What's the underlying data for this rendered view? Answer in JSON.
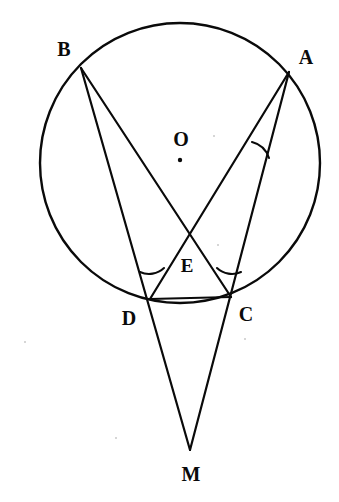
{
  "figure": {
    "background_color": "#ffffff",
    "stroke_color": "#0a0a0a",
    "width": 339,
    "height": 502
  },
  "circle": {
    "name": "circumscribed-circle",
    "center_x": 180,
    "center_y": 163,
    "radius": 140,
    "stroke_width": 2.4
  },
  "center_marker": {
    "name": "center-dot",
    "x": 180,
    "y": 160,
    "radius": 2.2
  },
  "points": [
    {
      "id": "B",
      "label": "B",
      "x": 81,
      "y": 68,
      "label_x": 64,
      "label_y": 49,
      "size": "lbl-20"
    },
    {
      "id": "A",
      "label": "A",
      "x": 289,
      "y": 72,
      "label_x": 306,
      "label_y": 57,
      "size": "lbl-20"
    },
    {
      "id": "O",
      "label": "O",
      "x": 180,
      "y": 160,
      "label_x": 181,
      "label_y": 139,
      "size": "lbl-20"
    },
    {
      "id": "E",
      "label": "E",
      "x": 190,
      "y": 237,
      "label_x": 187,
      "label_y": 265,
      "size": "lbl-19"
    },
    {
      "id": "D",
      "label": "D",
      "x": 150,
      "y": 299,
      "label_x": 129,
      "label_y": 318,
      "size": "lbl-20"
    },
    {
      "id": "C",
      "label": "C",
      "x": 231,
      "y": 297,
      "label_x": 246,
      "label_y": 314,
      "size": "lbl-20"
    },
    {
      "id": "M",
      "label": "M",
      "x": 190,
      "y": 450,
      "label_x": 191,
      "label_y": 474,
      "size": "lbl-20"
    }
  ],
  "segments": [
    {
      "name": "segment-B-to-M",
      "from": "B",
      "to": "M",
      "x1": 81,
      "y1": 68,
      "x2": 190,
      "y2": 450,
      "stroke_width": 2.2
    },
    {
      "name": "segment-B-to-C",
      "from": "B",
      "to": "C",
      "x1": 81,
      "y1": 68,
      "x2": 231,
      "y2": 297,
      "stroke_width": 2.2
    },
    {
      "name": "segment-A-to-M",
      "from": "A",
      "to": "M",
      "x1": 289,
      "y1": 72,
      "x2": 190,
      "y2": 450,
      "stroke_width": 2.2
    },
    {
      "name": "segment-A-to-D",
      "from": "A",
      "to": "D",
      "x1": 289,
      "y1": 72,
      "x2": 150,
      "y2": 299,
      "stroke_width": 2.2
    },
    {
      "name": "segment-D-to-C",
      "from": "D",
      "to": "C",
      "x1": 150,
      "y1": 299,
      "x2": 231,
      "y2": 297,
      "stroke_width": 2.2
    }
  ],
  "angle_arcs": [
    {
      "name": "angle-arc-at-A",
      "vertex": "A",
      "path": "M 269 158 A 24 24 0 0 0 252 142",
      "stroke_width": 2.1
    },
    {
      "name": "angle-arc-at-D",
      "vertex": "D",
      "path": "M 140 272 A 22 22 0 0 0 163 268",
      "stroke_width": 2.1
    },
    {
      "name": "angle-arc-at-C",
      "vertex": "C",
      "path": "M 218 268 A 22 22 0 0 0 241 271",
      "stroke_width": 2.1
    }
  ],
  "specks": [
    {
      "name": "paper-speck",
      "x": 24,
      "y": 341
    },
    {
      "name": "paper-speck",
      "x": 244,
      "y": 338
    },
    {
      "name": "paper-speck",
      "x": 115,
      "y": 437
    },
    {
      "name": "paper-speck",
      "x": 213,
      "y": 135
    },
    {
      "name": "paper-speck",
      "x": 217,
      "y": 244
    }
  ]
}
